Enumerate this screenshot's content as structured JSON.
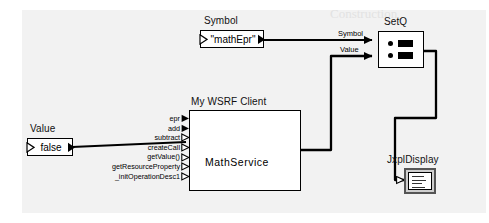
{
  "diagram": {
    "type": "dataflow-graph",
    "background_color": "#f2f2f2",
    "line_color": "#000000",
    "node_fill": "#ffffff"
  },
  "ghost_text": {
    "line1": "Construction"
  },
  "nodes": {
    "symbol_const": {
      "title": "Symbol",
      "value": "\"mathEpr\"",
      "shape": "const-box"
    },
    "value_const": {
      "title": "Value",
      "value": "false",
      "shape": "const-box"
    },
    "setq": {
      "title": "SetQ",
      "icon": "setq-two-row-icon",
      "input_ports": [
        "Symbol",
        "Value"
      ]
    },
    "wsrf_client": {
      "title": "My WSRF Client",
      "label": "MathService",
      "ports": [
        {
          "name": "epr",
          "filled": true
        },
        {
          "name": "add",
          "filled": true
        },
        {
          "name": "subtract",
          "filled": false
        },
        {
          "name": "createCall",
          "filled": false
        },
        {
          "name": "getValue()",
          "filled": false
        },
        {
          "name": "getResourceProperty",
          "filled": false
        },
        {
          "name": "_initOperationDesc1",
          "filled": false
        }
      ]
    },
    "display": {
      "title": "JxplDisplay",
      "icon": "text-display-icon"
    }
  },
  "wire_labels": {
    "symbol": "Symbol",
    "value": "Value"
  },
  "connections": [
    {
      "from": "symbol_const.output",
      "to": "setq.Symbol",
      "label": "Symbol"
    },
    {
      "from": "value_const.output",
      "to": "wsrf_client.getValue",
      "label": ""
    },
    {
      "from": "wsrf_client.output",
      "to": "setq.Value",
      "label": "Value"
    },
    {
      "from": "setq.output",
      "to": "display.input",
      "label": ""
    }
  ]
}
